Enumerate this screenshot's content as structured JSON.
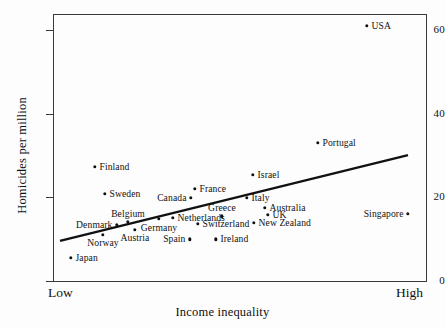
{
  "chart_data": {
    "type": "scatter",
    "title": "",
    "xlabel": "Income inequality",
    "ylabel": "Homicides per million",
    "x_tick_labels": [
      "Low",
      "High"
    ],
    "y_ticks": [
      0,
      20,
      40,
      60
    ],
    "ylim": [
      0,
      64
    ],
    "xlim_labels": [
      "Low",
      "High"
    ],
    "grid": false,
    "legend": null,
    "trend_line": {
      "present": true,
      "description": "fitted regression line rising from lower-left to upper-right",
      "x_start_px": 60,
      "y_start_value": 9.6,
      "x_end_px": 408,
      "y_end_value": 30.1
    },
    "points": [
      {
        "name": "USA",
        "x_px": 367,
        "y": 61.0,
        "label_pos": "right"
      },
      {
        "name": "Portugal",
        "x_px": 318,
        "y": 33.0,
        "label_pos": "right"
      },
      {
        "name": "Finland",
        "x_px": 95,
        "y": 27.3,
        "label_pos": "right"
      },
      {
        "name": "Israel",
        "x_px": 253,
        "y": 25.4,
        "label_pos": "right"
      },
      {
        "name": "France",
        "x_px": 195,
        "y": 22.0,
        "label_pos": "right"
      },
      {
        "name": "Sweden",
        "x_px": 105,
        "y": 20.8,
        "label_pos": "right"
      },
      {
        "name": "Canada",
        "x_px": 191,
        "y": 19.9,
        "label_pos": "left"
      },
      {
        "name": "Italy",
        "x_px": 247,
        "y": 19.9,
        "label_pos": "right"
      },
      {
        "name": "Australia",
        "x_px": 265,
        "y": 17.5,
        "label_pos": "right"
      },
      {
        "name": "UK",
        "x_px": 268,
        "y": 15.8,
        "label_pos": "right"
      },
      {
        "name": "Singapore",
        "x_px": 408,
        "y": 16.0,
        "label_pos": "left"
      },
      {
        "name": "Greece",
        "x_px": 222,
        "y": 15.5,
        "label_pos": "above"
      },
      {
        "name": "Netherlands",
        "x_px": 173,
        "y": 15.1,
        "label_pos": "right"
      },
      {
        "name": "Germany",
        "x_px": 159,
        "y": 14.8,
        "label_pos": "below"
      },
      {
        "name": "New Zealand",
        "x_px": 254,
        "y": 13.9,
        "label_pos": "right"
      },
      {
        "name": "Belgium",
        "x_px": 128,
        "y": 14.1,
        "label_pos": "above"
      },
      {
        "name": "Denmark",
        "x_px": 117,
        "y": 13.4,
        "label_pos": "left"
      },
      {
        "name": "Switzerland",
        "x_px": 198,
        "y": 13.6,
        "label_pos": "right"
      },
      {
        "name": "Austria",
        "x_px": 135,
        "y": 12.2,
        "label_pos": "below"
      },
      {
        "name": "Norway",
        "x_px": 103,
        "y": 11.0,
        "label_pos": "below"
      },
      {
        "name": "Spain",
        "x_px": 190,
        "y": 10.0,
        "label_pos": "left"
      },
      {
        "name": "Ireland",
        "x_px": 216,
        "y": 10.0,
        "label_pos": "right"
      },
      {
        "name": "Japan",
        "x_px": 71,
        "y": 5.5,
        "label_pos": "right"
      }
    ]
  },
  "axes": {
    "y_title": "Homicides per million",
    "x_title": "Income inequality",
    "x_low": "Low",
    "x_high": "High",
    "y_tick_labels": [
      "0",
      "20",
      "40",
      "60"
    ]
  },
  "colors": {
    "point": "#111111",
    "line": "#111111",
    "frame": "#3a3a3a",
    "background": "#fdfdfd"
  }
}
